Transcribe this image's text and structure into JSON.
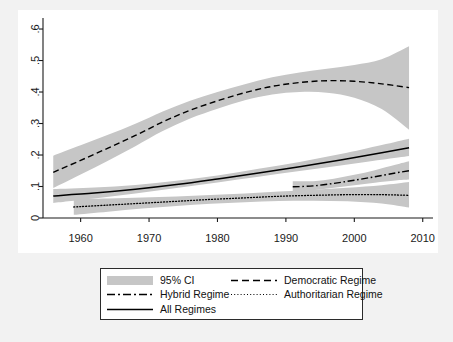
{
  "figure": {
    "background_color": "#f2f2f2",
    "plot_background_color": "#ffffff",
    "ci_color": "#c6c6c6",
    "line_color": "#000000"
  },
  "legend": {
    "items": [
      {
        "label": "95% CI",
        "key": "shaded-band"
      },
      {
        "label": "Democratic Regime",
        "key": "dashed-line"
      },
      {
        "label": "Hybrid Regime",
        "key": "dash-dot-line"
      },
      {
        "label": "Authoritarian Regime",
        "key": "dotted-line"
      },
      {
        "label": "All Regimes",
        "key": "solid-line"
      }
    ]
  },
  "chart_data": {
    "type": "line",
    "title": "",
    "xlabel": "",
    "ylabel": "",
    "xlim": [
      1954.5,
      2011.5
    ],
    "ylim": [
      0,
      0.635
    ],
    "xticks": [
      1960,
      1970,
      1980,
      1990,
      2000,
      2010
    ],
    "xticklabels": [
      "1960",
      "1970",
      "1980",
      "1990",
      "2000",
      "2010"
    ],
    "yticks": [
      0,
      0.1,
      0.2,
      0.3,
      0.4,
      0.5,
      0.6
    ],
    "yticklabels": [
      "0",
      ".1",
      ".2",
      ".3",
      ".4",
      ".5",
      ".6"
    ],
    "grid": false,
    "legend_position": "below-axes",
    "ci_level": "95%",
    "series": [
      {
        "name": "Democratic Regime",
        "style": "dashed",
        "x": [
          1956,
          1960,
          1964,
          1968,
          1972,
          1976,
          1980,
          1984,
          1988,
          1992,
          1996,
          2000,
          2004,
          2008
        ],
        "values": [
          0.145,
          0.183,
          0.222,
          0.262,
          0.305,
          0.342,
          0.372,
          0.398,
          0.418,
          0.43,
          0.436,
          0.434,
          0.426,
          0.414
        ],
        "ci_lower": [
          0.095,
          0.138,
          0.182,
          0.228,
          0.276,
          0.316,
          0.347,
          0.374,
          0.392,
          0.4,
          0.398,
          0.382,
          0.346,
          0.28
        ],
        "ci_upper": [
          0.198,
          0.231,
          0.264,
          0.299,
          0.338,
          0.372,
          0.4,
          0.425,
          0.447,
          0.462,
          0.474,
          0.486,
          0.504,
          0.545
        ]
      },
      {
        "name": "Hybrid Regime",
        "style": "dash-dot",
        "x": [
          1991,
          1994,
          1997,
          2000,
          2003,
          2006,
          2008
        ],
        "values": [
          0.099,
          0.102,
          0.11,
          0.12,
          0.131,
          0.143,
          0.15
        ],
        "ci_lower": [
          0.082,
          0.088,
          0.096,
          0.104,
          0.112,
          0.119,
          0.122
        ],
        "ci_upper": [
          0.117,
          0.117,
          0.125,
          0.137,
          0.152,
          0.169,
          0.18
        ]
      },
      {
        "name": "Authoritarian Regime",
        "style": "dotted",
        "x": [
          1959,
          1964,
          1969,
          1974,
          1979,
          1984,
          1989,
          1994,
          1999,
          2004,
          2008
        ],
        "values": [
          0.035,
          0.041,
          0.047,
          0.053,
          0.059,
          0.064,
          0.069,
          0.072,
          0.074,
          0.074,
          0.072
        ],
        "ci_lower": [
          0.01,
          0.02,
          0.03,
          0.038,
          0.045,
          0.05,
          0.054,
          0.055,
          0.053,
          0.046,
          0.033
        ],
        "ci_upper": [
          0.06,
          0.062,
          0.065,
          0.068,
          0.073,
          0.078,
          0.084,
          0.09,
          0.096,
          0.104,
          0.114
        ]
      },
      {
        "name": "All Regimes",
        "style": "solid",
        "x": [
          1956,
          1962,
          1968,
          1974,
          1980,
          1986,
          1992,
          1998,
          2004,
          2008
        ],
        "values": [
          0.07,
          0.079,
          0.091,
          0.106,
          0.124,
          0.143,
          0.163,
          0.184,
          0.207,
          0.223
        ],
        "ci_lower": [
          0.048,
          0.062,
          0.078,
          0.095,
          0.113,
          0.131,
          0.149,
          0.167,
          0.185,
          0.197
        ],
        "ci_upper": [
          0.092,
          0.097,
          0.105,
          0.118,
          0.135,
          0.156,
          0.178,
          0.203,
          0.232,
          0.252
        ]
      }
    ]
  }
}
